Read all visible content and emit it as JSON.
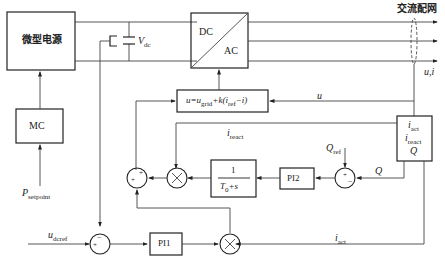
{
  "diagram": {
    "title_grid": "交流配网",
    "blocks": {
      "micro_source": "微型电源",
      "mc": "MC",
      "inverter_dc": "DC",
      "inverter_ac": "AC",
      "control_law": "u=u_grid+k(i_ref−i)",
      "control_law_parts": {
        "u": "u=u",
        "grid_sub": "grid",
        "k": "+k(i",
        "ref_sub": "ref",
        "tail": "−i)"
      },
      "filter_num": "1",
      "filter_den": "T0+s",
      "filter_den_parts": {
        "T": "T",
        "sub": "0",
        "tail": "+s"
      },
      "pi1": "PI1",
      "pi2": "PI2",
      "meas": {
        "iact": "i",
        "iact_sub": "act",
        "ireact": "i",
        "ireact_sub": "react",
        "Q": "Q"
      }
    },
    "labels": {
      "vdc": "V",
      "vdc_sub": "dc",
      "ui": "u,i",
      "u": "u",
      "ireact": "i",
      "ireact_sub": "react",
      "qref": "Q",
      "qref_sub": "ref",
      "q": "Q",
      "iact": "i",
      "iact_sub": "act",
      "psetpoint": "P",
      "psetpoint_sub": "setpoint",
      "udcref": "u",
      "udcref_sub": "dcref"
    },
    "signs": {
      "plus": "+",
      "minus": "−",
      "times": "×"
    }
  }
}
